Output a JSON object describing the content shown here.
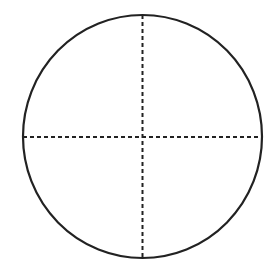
{
  "diagram": {
    "type": "circle-divided-into-quadrants",
    "canvas": {
      "width": 273,
      "height": 261,
      "background": "#ffffff"
    },
    "circle": {
      "cx": 142.5,
      "cy": 136.5,
      "rx": 119.5,
      "ry": 121.5,
      "stroke": "#222222",
      "stroke_width": 2.2
    },
    "dividers": {
      "style": "dashed",
      "stroke": "#222222",
      "stroke_width": 2,
      "dash": "4 3",
      "vertical": {
        "x": 142.5,
        "y1": 15,
        "y2": 258
      },
      "horizontal": {
        "y": 137,
        "x1": 23,
        "x2": 262
      }
    }
  }
}
